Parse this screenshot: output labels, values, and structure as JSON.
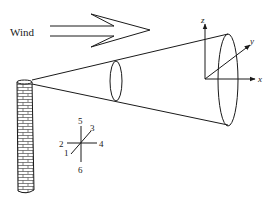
{
  "diagram": {
    "wind_label": "Wind",
    "axes": {
      "x_label": "x",
      "y_label": "y",
      "z_label": "z"
    },
    "direction_key": {
      "labels": [
        "1",
        "2",
        "3",
        "4",
        "5",
        "6"
      ]
    },
    "elements": [
      "stack",
      "wind-arrow",
      "plume-cone",
      "plume-cross-section-small",
      "plume-cross-section-large",
      "coordinate-axes",
      "direction-key"
    ],
    "colors": {
      "line": "#1a1a1a",
      "background": "#ffffff"
    }
  }
}
